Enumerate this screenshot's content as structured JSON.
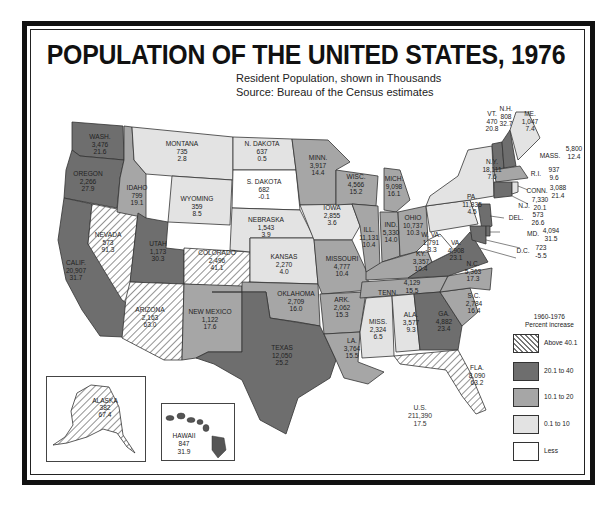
{
  "title": "POPULATION OF THE UNITED STATES, 1976",
  "subtitle_1": "Resident Population, shown in Thousands",
  "subtitle_2": "Source: Bureau of the Census estimates",
  "colors": {
    "above_40": "hatch",
    "20_to_40": "#6e6e6e",
    "10_to_20": "#a6a6a6",
    "0_to_10": "#e3e3e3",
    "less": "#ffffff",
    "frame": "#111111"
  },
  "legend": {
    "title_1": "1960-1976",
    "title_2": "Percent increase",
    "items": [
      {
        "label": "Above 40.1",
        "class": "hatch"
      },
      {
        "label": "20.1 to 40",
        "class": "dark"
      },
      {
        "label": "10.1 to 20",
        "class": "mid"
      },
      {
        "label": "0.1 to 10",
        "class": "light"
      },
      {
        "label": "Less",
        "class": "white"
      }
    ]
  },
  "us_total": {
    "name": "U.S.",
    "population": "211,390",
    "pct": "17.5"
  },
  "states": {
    "wash": {
      "name": "WASH.",
      "population": "3,476",
      "pct": "21.6"
    },
    "oregon": {
      "name": "OREGON",
      "population": "2,266",
      "pct": "27.9"
    },
    "calif": {
      "name": "CALIF.",
      "population": "20,907",
      "pct": "31.7"
    },
    "nevada": {
      "name": "NEVADA",
      "population": "573",
      "pct": "91.3"
    },
    "idaho": {
      "name": "IDAHO",
      "population": "799",
      "pct": "19.1"
    },
    "montana": {
      "name": "MONTANA",
      "population": "735",
      "pct": "2.8"
    },
    "wyoming": {
      "name": "WYOMING",
      "population": "359",
      "pct": "8.5"
    },
    "utah": {
      "name": "UTAH",
      "population": "1,173",
      "pct": "30.3"
    },
    "colorado": {
      "name": "COLORADO",
      "population": "2,496",
      "pct": "41.1"
    },
    "arizona": {
      "name": "ARIZONA",
      "population": "2,163",
      "pct": "63.0"
    },
    "new_mexico": {
      "name": "NEW MEXICO",
      "population": "1,122",
      "pct": "17.6"
    },
    "n_dakota": {
      "name": "N. DAKOTA",
      "population": "637",
      "pct": "0.5"
    },
    "s_dakota": {
      "name": "S. DAKOTA",
      "population": "682",
      "pct": "-0.1"
    },
    "nebraska": {
      "name": "NEBRASKA",
      "population": "1,543",
      "pct": "3.9"
    },
    "kansas": {
      "name": "KANSAS",
      "population": "2,270",
      "pct": "4.0"
    },
    "oklahoma": {
      "name": "OKLAHOMA",
      "population": "2,709",
      "pct": "16.0"
    },
    "texas": {
      "name": "TEXAS",
      "population": "12,050",
      "pct": "25.2"
    },
    "minn": {
      "name": "MINN.",
      "population": "3,917",
      "pct": "14.4"
    },
    "iowa": {
      "name": "IOWA",
      "population": "2,855",
      "pct": "3.6"
    },
    "missouri": {
      "name": "MISSOURI",
      "population": "4,777",
      "pct": "10.4"
    },
    "ark": {
      "name": "ARK.",
      "population": "2,062",
      "pct": "15.3"
    },
    "la": {
      "name": "LA.",
      "population": "3,764",
      "pct": "15.5"
    },
    "wisc": {
      "name": "WISC.",
      "population": "4,566",
      "pct": "15.2"
    },
    "ill": {
      "name": "ILL.",
      "population": "11,131",
      "pct": "10.4"
    },
    "mich": {
      "name": "MICH.",
      "population": "9,098",
      "pct": "16.1"
    },
    "ind": {
      "name": "IND.",
      "population": "5,330",
      "pct": "14.0"
    },
    "ohio": {
      "name": "OHIO",
      "population": "10,737",
      "pct": "10.3"
    },
    "ky": {
      "name": "KY.",
      "population": "3,357",
      "pct": "10.4"
    },
    "tenn": {
      "name": "TENN.",
      "population": "4,129",
      "pct": "15.5"
    },
    "miss": {
      "name": "MISS.",
      "population": "2,324",
      "pct": "6.5"
    },
    "ala": {
      "name": "ALA.",
      "population": "3,577",
      "pct": "9.3"
    },
    "ga": {
      "name": "GA.",
      "population": "4,882",
      "pct": "23.4"
    },
    "fla": {
      "name": "FLA.",
      "population": "8,090",
      "pct": "63.2"
    },
    "sc": {
      "name": "S.C.",
      "population": "2,784",
      "pct": "16.4"
    },
    "nc": {
      "name": "N.C.",
      "population": "5,363",
      "pct": "17.3"
    },
    "va": {
      "name": "VA.",
      "population": "4,908",
      "pct": "23.1"
    },
    "w_va": {
      "name": "W. VA.",
      "population": "1,791",
      "pct": "-3.3"
    },
    "pa": {
      "name": "PA.",
      "population": "11,835",
      "pct": "4.5"
    },
    "ny": {
      "name": "N.Y.",
      "population": "18,111",
      "pct": "7.6"
    },
    "vt": {
      "name": "VT.",
      "population": "470",
      "pct": "20.8"
    },
    "nh": {
      "name": "N.H.",
      "population": "808",
      "pct": "32.7"
    },
    "me": {
      "name": "ME.",
      "population": "1,047",
      "pct": "7.4"
    },
    "mass": {
      "name": "MASS.",
      "population": "5,800",
      "pct": "12.4"
    },
    "ri": {
      "name": "R.I.",
      "population": "937",
      "pct": "9.6"
    },
    "conn": {
      "name": "CONN.",
      "population": "3,088",
      "pct": "21.4"
    },
    "nj": {
      "name": "N.J.",
      "population": "7,330",
      "pct": "20.1"
    },
    "del": {
      "name": "DEL.",
      "population": "573",
      "pct": "26.6"
    },
    "md": {
      "name": "MD.",
      "population": "4,094",
      "pct": "31.5"
    },
    "dc": {
      "name": "D.C.",
      "population": "723",
      "pct": "-5.5"
    },
    "alaska": {
      "name": "ALASKA",
      "population": "382",
      "pct": "67.4"
    },
    "hawaii": {
      "name": "HAWAII",
      "population": "847",
      "pct": "31.9"
    }
  }
}
